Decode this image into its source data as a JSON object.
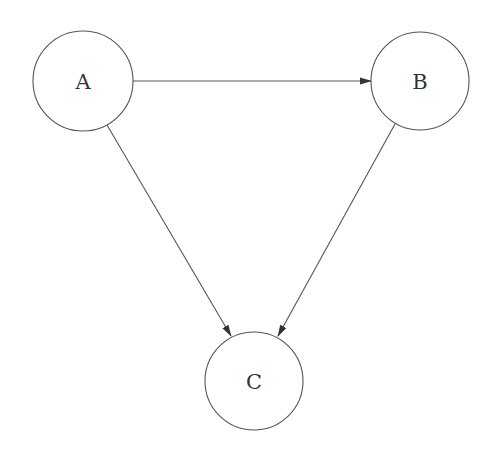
{
  "diagram": {
    "type": "directed-graph",
    "background": "#ffffff",
    "stroke_color": "#555555",
    "nodes": [
      {
        "id": "A",
        "label": "A",
        "cx": 83,
        "cy": 81,
        "r": 50
      },
      {
        "id": "B",
        "label": "B",
        "cx": 420,
        "cy": 81,
        "r": 49
      },
      {
        "id": "C",
        "label": "C",
        "cx": 254,
        "cy": 381,
        "r": 49
      }
    ],
    "edges": [
      {
        "from": "A",
        "to": "B",
        "x1": 133,
        "y1": 81,
        "x2": 371,
        "y2": 81
      },
      {
        "from": "A",
        "to": "C",
        "x1": 107,
        "y1": 125,
        "x2": 231,
        "y2": 336
      },
      {
        "from": "B",
        "to": "C",
        "x1": 395,
        "y1": 124,
        "x2": 278,
        "y2": 336
      }
    ]
  }
}
